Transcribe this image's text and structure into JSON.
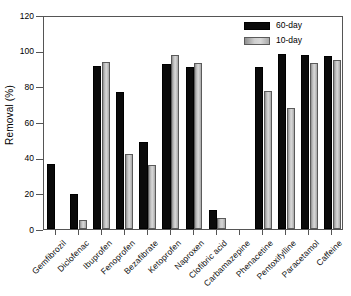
{
  "chart_data": {
    "type": "bar",
    "title": "",
    "xlabel": "",
    "ylabel": "Removal (%)",
    "ylim": [
      0,
      120
    ],
    "yticks": [
      0,
      20,
      40,
      60,
      80,
      100,
      120
    ],
    "ytick_labels": [
      "0",
      "20",
      "40",
      "60",
      "80",
      "100",
      "120"
    ],
    "grid": false,
    "legend_position": "top-right",
    "categories": [
      "Gemfibrozil",
      "Diclofenac",
      "Ibuprofen",
      "Fenoprofen",
      "Bezafibrate",
      "Ketoprofen",
      "Naproxen",
      "Clofibric acid",
      "Carbamazepine",
      "Phenacetine",
      "Pentoxifylline",
      "Paracetamol",
      "Caffeine"
    ],
    "series": [
      {
        "name": "60-day",
        "color": "#0a0a0a",
        "values": [
          36.3,
          19.5,
          91.4,
          77.1,
          48.6,
          92.5,
          90.6,
          10.9,
          0,
          91.0,
          98.0,
          97.6,
          97.1
        ]
      },
      {
        "name": "10-day",
        "color": "#c9c9c9",
        "values": [
          0,
          5.1,
          93.4,
          41.8,
          35.9,
          97.4,
          92.9,
          6.4,
          0,
          77.4,
          67.8,
          92.9,
          94.5
        ]
      }
    ]
  },
  "legend": {
    "items": [
      {
        "label": "60-day"
      },
      {
        "label": "10-day"
      }
    ]
  }
}
